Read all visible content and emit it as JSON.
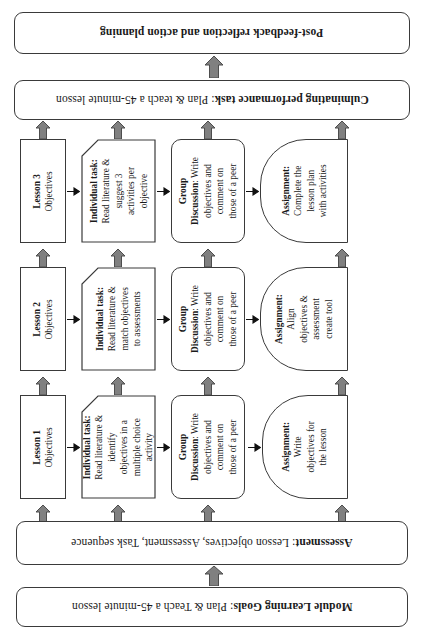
{
  "diagram": {
    "title_top": "Post-feedback reflection and action planning",
    "bars": {
      "post_feedback": {
        "label": "Post-feedback reflection and action planning",
        "bold_part": "Post-feedback reflection and action planning",
        "plain_part": ""
      },
      "culminating": {
        "bold_part": "Culminating performance task",
        "plain_part": ": Plan & teach a 45-minute lesson"
      },
      "assessment": {
        "bold_part": "Assessment",
        "plain_part": ": Lesson objectives, Assessment, Task sequence"
      },
      "module_goals": {
        "bold_part": "Module Learning Goals",
        "plain_part": ": Plan & Teach a 45-minute lesson"
      }
    },
    "rows": [
      {
        "id": "lesson-3",
        "lesson": {
          "bold_part": "Lesson 3",
          "lines": [
            "Objectives"
          ]
        },
        "individual_task": {
          "bold_part": "Individual task:",
          "lines": [
            "Read literature &",
            "suggest 3",
            "activities per",
            "objective"
          ]
        },
        "group_discussion": {
          "bold_part": "Group",
          "bold_part2": "Discussion",
          "lines": [
            ": Write",
            "objectives and",
            "comment on",
            "those of a peer"
          ]
        },
        "assignment": {
          "bold_part": "Assignment:",
          "lines": [
            "Complete the",
            "lesson plan",
            "with activities"
          ]
        }
      },
      {
        "id": "lesson-2",
        "lesson": {
          "bold_part": "Lesson 2",
          "lines": [
            "Objectives"
          ]
        },
        "individual_task": {
          "bold_part": "Individual task:",
          "lines": [
            "Read literature &",
            "match objectives",
            "to assessments"
          ]
        },
        "group_discussion": {
          "bold_part": "Group",
          "bold_part2": "Discussion",
          "lines": [
            ": Write",
            "objectives and",
            "comment on",
            "those of a peer"
          ]
        },
        "assignment": {
          "bold_part": "Assignment:",
          "lines": [
            "Align",
            "objectives &",
            "assessment",
            "create tool"
          ]
        }
      },
      {
        "id": "lesson-1",
        "lesson": {
          "bold_part": "Lesson 1",
          "lines": [
            "Objectives"
          ]
        },
        "individual_task": {
          "bold_part": "Individual task:",
          "lines": [
            "Read literature &",
            "identify",
            "objectives in a",
            "multiple choice",
            "activity"
          ]
        },
        "group_discussion": {
          "bold_part": "Group",
          "bold_part2": "Discussion",
          "lines": [
            ": Write",
            "objectives and",
            "comment on",
            "those of a peer"
          ]
        },
        "assignment": {
          "bold_part": "Assignment:",
          "lines": [
            "Write",
            "objectives for",
            "the lesson"
          ]
        }
      }
    ],
    "colors": {
      "arrow_fill": "#808080",
      "arrow_stroke": "#4d4d4d",
      "box_stroke": "#3a3a3a",
      "text": "#1a1a1a",
      "background": "#ffffff"
    }
  }
}
